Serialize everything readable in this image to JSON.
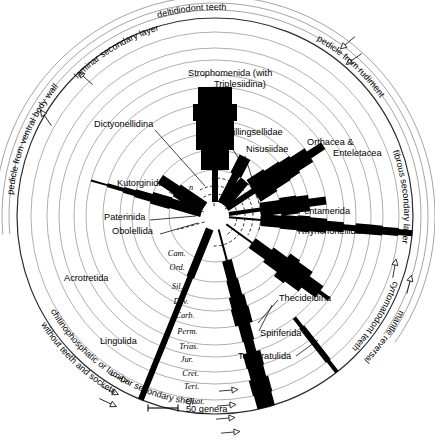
{
  "figure": {
    "type": "radial-spindle",
    "center": [
      215,
      216
    ],
    "scale_bar": {
      "label": "50 genera",
      "length_px": 30
    },
    "center_symbol": "n"
  },
  "time_axis": {
    "name": "Geological periods (inner to outer)",
    "periods": [
      {
        "abbr": "Cam.",
        "name": "Cambrian",
        "radius": 46
      },
      {
        "abbr": "Ord.",
        "name": "Ordovician",
        "radius": 66
      },
      {
        "abbr": "Sil.",
        "name": "Silurian",
        "radius": 83
      },
      {
        "abbr": "Dev.",
        "name": "Devonian",
        "radius": 95
      },
      {
        "abbr": "Carb.",
        "name": "Carboniferous",
        "radius": 112
      },
      {
        "abbr": "Perm.",
        "name": "Permian",
        "radius": 129
      },
      {
        "abbr": "Trias.",
        "name": "Triassic",
        "radius": 141
      },
      {
        "abbr": "Jur.",
        "name": "Jurassic",
        "radius": 156
      },
      {
        "abbr": "Cret.",
        "name": "Cretaceous",
        "radius": 168
      },
      {
        "abbr": "Tert.",
        "name": "Tertiary",
        "radius": 184
      },
      {
        "abbr": "Quat.",
        "name": "Quaternary",
        "radius": 198
      }
    ]
  },
  "taxa_labels": [
    {
      "id": "strophomenida",
      "text": "Strophomenida (with",
      "text2": "Triplesiidina)",
      "x": 188,
      "y": 76,
      "anchor": "start"
    },
    {
      "id": "dictyonellidina",
      "text": "Dictyonellidina",
      "x": 94,
      "y": 127,
      "anchor": "start"
    },
    {
      "id": "billingsellidae",
      "text": "Billingsellidae",
      "x": 227,
      "y": 135,
      "anchor": "start"
    },
    {
      "id": "nisusiidae",
      "text": "Nisusiidae",
      "x": 246,
      "y": 152,
      "anchor": "start"
    },
    {
      "id": "orthacea",
      "text": "Orthacea &",
      "text2": "Enteletacea",
      "x": 307,
      "y": 145,
      "anchor": "start"
    },
    {
      "id": "kutorginida",
      "text": "Kutorginida",
      "x": 117,
      "y": 186,
      "anchor": "start"
    },
    {
      "id": "paterinida",
      "text": "Paterinida",
      "x": 104,
      "y": 220,
      "anchor": "start"
    },
    {
      "id": "obolellida",
      "text": "Obolellida",
      "x": 112,
      "y": 234,
      "anchor": "start"
    },
    {
      "id": "pentamerida",
      "text": "Pentamerida",
      "x": 298,
      "y": 214,
      "anchor": "start"
    },
    {
      "id": "rhynchonellida",
      "text": "Rhynchonellida",
      "x": 298,
      "y": 234,
      "anchor": "start"
    },
    {
      "id": "acrotretida",
      "text": "Acrotretida",
      "x": 64,
      "y": 281,
      "anchor": "start"
    },
    {
      "id": "thecideidina",
      "text": "Thecideidina",
      "x": 279,
      "y": 301,
      "anchor": "start"
    },
    {
      "id": "lingulida",
      "text": "Lingulida",
      "x": 100,
      "y": 344,
      "anchor": "start"
    },
    {
      "id": "spiriferida",
      "text": "Spiriferida",
      "x": 260,
      "y": 336,
      "anchor": "start"
    },
    {
      "id": "terebratulida",
      "text": "Terebratulida",
      "x": 238,
      "y": 359,
      "anchor": "start"
    }
  ],
  "annotations_curved": [
    {
      "id": "deltidiodont-teeth",
      "text": "deltidiodont  teeth",
      "radius": 206,
      "start_deg": -108,
      "dir": 1
    },
    {
      "id": "laminar-secondary-layer",
      "text": "laminar  secondary  layer",
      "radius": 194,
      "start_deg": -137,
      "dir": 1
    },
    {
      "id": "pedicle-ventral-body-wall",
      "text": "pedicle from ventral body wall",
      "radius": 203,
      "start_deg": -176,
      "dir": 1
    },
    {
      "id": "chitinophosphatic-shell",
      "text": "chitinophosphatic or laminar secondary shell",
      "radius": 190,
      "start_deg": 152,
      "dir": -1
    },
    {
      "id": "without-teeth-sockets",
      "text": "without teeth and sockets",
      "radius": 205,
      "start_deg": 150,
      "dir": -1
    },
    {
      "id": "pedicle-from-rudiment",
      "text": "pedicle  from  rudiment",
      "radius": 203,
      "start_deg": -62,
      "dir": 1
    },
    {
      "id": "fibrous-secondary-layer",
      "text": "fibrous  secondary  layer",
      "radius": 189,
      "start_deg": -22,
      "dir": 1
    },
    {
      "id": "cyrtomatodont-teeth",
      "text": "cyrtomatodont  teeth",
      "radius": 190,
      "start_deg": 18,
      "dir": 1
    },
    {
      "id": "mantle-reversal",
      "text": "mantle   reversal",
      "radius": 207,
      "start_deg": 25,
      "dir": 1
    }
  ],
  "spindles": [
    {
      "id": "strophomenida-spindle",
      "angle_deg": -90,
      "half_widths": [
        3,
        14,
        19,
        19,
        22,
        17,
        0,
        0,
        0,
        0,
        0
      ],
      "fill": "#000000"
    },
    {
      "id": "billingsellidae-spindle",
      "angle_deg": -63,
      "half_widths": [
        4,
        6,
        0,
        0,
        0,
        0,
        0,
        0,
        0,
        0,
        0
      ],
      "fill": "#000000"
    },
    {
      "id": "nisusiidae-spindle",
      "angle_deg": -50,
      "half_widths": [
        5,
        0,
        0,
        0,
        0,
        0,
        0,
        0,
        0,
        0,
        0
      ],
      "fill": "#000000"
    },
    {
      "id": "orthacea-spindle",
      "angle_deg": -33,
      "half_widths": [
        3,
        13,
        11,
        10,
        8,
        4,
        0,
        0,
        0,
        0,
        0
      ],
      "fill": "#000000"
    },
    {
      "id": "pentamerida-spindle",
      "angle_deg": -8,
      "half_widths": [
        2,
        7,
        9,
        8,
        4,
        0,
        0,
        0,
        0,
        0,
        0
      ],
      "fill": "#000000"
    },
    {
      "id": "rhynchonellida-spindle",
      "angle_deg": 5,
      "half_widths": [
        1,
        6,
        7,
        8,
        7,
        5,
        3,
        5,
        5,
        4,
        3
      ],
      "fill": "#000000"
    },
    {
      "id": "spiriferida-spindle",
      "angle_deg": 36,
      "half_widths": [
        1,
        6,
        9,
        14,
        12,
        7,
        2,
        0,
        0,
        0,
        0
      ],
      "fill": "#000000"
    },
    {
      "id": "thecideidina-spindle",
      "angle_deg": 52,
      "half_widths": [
        0,
        0,
        0,
        0,
        0,
        0,
        2,
        3,
        3,
        3,
        2
      ],
      "fill": "#000000"
    },
    {
      "id": "terebratulida-spindle",
      "angle_deg": 75,
      "half_widths": [
        1,
        5,
        6,
        8,
        9,
        6,
        5,
        9,
        8,
        10,
        9
      ],
      "fill": "#000000"
    },
    {
      "id": "obolellida-spindle",
      "angle_deg": 214,
      "half_widths": [
        7,
        5,
        0,
        0,
        0,
        0,
        0,
        0,
        0,
        0,
        0
      ],
      "fill": "#000000"
    },
    {
      "id": "acrotretida-spindle",
      "angle_deg": 196,
      "half_widths": [
        5,
        6,
        4,
        3,
        2,
        1,
        0,
        0,
        0,
        0,
        0
      ],
      "fill": "#000000"
    },
    {
      "id": "lingulida-spindle",
      "angle_deg": 112,
      "half_widths": [
        4,
        4,
        3,
        3,
        3,
        3,
        3,
        3,
        3,
        3,
        3
      ],
      "fill": "#000000"
    }
  ],
  "leaders": [
    {
      "id": "dictyonellidina-leader",
      "x1": 155,
      "y1": 130,
      "x2": 205,
      "y2": 186
    },
    {
      "id": "kutorginida-leader",
      "x1": 169,
      "y1": 192,
      "x2": 196,
      "y2": 207
    },
    {
      "id": "paterinida-leader",
      "x1": 150,
      "y1": 220,
      "x2": 196,
      "y2": 216
    },
    {
      "id": "obolellida-leader",
      "x1": 160,
      "y1": 234,
      "x2": 198,
      "y2": 223
    },
    {
      "id": "billingsellidae-leader",
      "x1": 226,
      "y1": 139,
      "x2": 243,
      "y2": 165
    },
    {
      "id": "nisusiidae-leader",
      "x1": 245,
      "y1": 156,
      "x2": 252,
      "y2": 178
    },
    {
      "id": "thecideidina-leader",
      "x1": 278,
      "y1": 300,
      "x2": 258,
      "y2": 323
    },
    {
      "id": "spiriferida-leader",
      "x1": 259,
      "y1": 331,
      "x2": 272,
      "y2": 305
    },
    {
      "id": "terebratulida-leader",
      "x1": 296,
      "y1": 356,
      "x2": 318,
      "y2": 340
    }
  ],
  "markers": [
    {
      "id": "marker-top-1",
      "x": 345,
      "y": 45,
      "rot": -40
    },
    {
      "id": "marker-top-2",
      "x": 351,
      "y": 61,
      "rot": -35
    },
    {
      "id": "marker-left-1",
      "x": 83,
      "y": 76,
      "rot": 42
    },
    {
      "id": "marker-left-2",
      "x": 44,
      "y": 115,
      "rot": 55
    },
    {
      "id": "marker-right-1",
      "x": 395,
      "y": 265,
      "rot": 100
    },
    {
      "id": "marker-right-2",
      "x": 410,
      "y": 281,
      "rot": 104
    },
    {
      "id": "marker-bot-1",
      "x": 232,
      "y": 390,
      "rot": 175
    },
    {
      "id": "marker-bot-2",
      "x": 230,
      "y": 405,
      "rot": 175
    },
    {
      "id": "marker-bot-3",
      "x": 229,
      "y": 418,
      "rot": 175
    },
    {
      "id": "marker-bot-4",
      "x": 234,
      "y": 432,
      "rot": 175
    },
    {
      "id": "marker-botleft-1",
      "x": 122,
      "y": 379,
      "rot": 200
    },
    {
      "id": "marker-botleft-2",
      "x": 113,
      "y": 392,
      "rot": 205
    },
    {
      "id": "marker-botleft-3",
      "x": 111,
      "y": 404,
      "rot": 205
    }
  ]
}
